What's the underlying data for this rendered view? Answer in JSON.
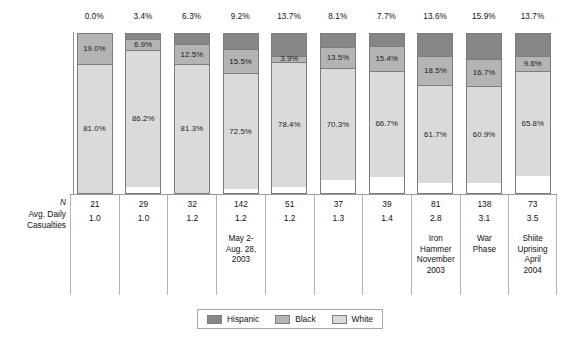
{
  "chart_data": {
    "type": "bar",
    "subtype": "stacked-100-percent",
    "title": "",
    "xlabel": "",
    "ylabel": "% of Total",
    "ylim": [
      0,
      100
    ],
    "grid": false,
    "legend_position": "bottom",
    "legend": [
      "Hispanic",
      "Black",
      "White"
    ],
    "categories": [
      "1",
      "2",
      "3",
      "4",
      "5",
      "6",
      "7",
      "8",
      "9",
      "10"
    ],
    "series": [
      {
        "name": "Hispanic",
        "color": "#878787",
        "values": [
          0.0,
          3.4,
          6.3,
          9.2,
          13.7,
          8.1,
          7.7,
          13.6,
          15.9,
          13.7
        ]
      },
      {
        "name": "Black",
        "color": "#b4b4b4",
        "values": [
          19.0,
          6.9,
          12.5,
          15.5,
          3.9,
          13.5,
          15.4,
          18.5,
          16.7,
          9.6
        ]
      },
      {
        "name": "White",
        "color": "#dadada",
        "values": [
          81.0,
          86.2,
          81.3,
          72.5,
          78.4,
          70.3,
          66.7,
          61.7,
          60.9,
          65.8
        ]
      }
    ],
    "top_labels": [
      "0.0%",
      "3.4%",
      "6.3%",
      "9.2%",
      "13.7%",
      "8.1%",
      "7.7%",
      "13.6%",
      "15.9%",
      "13.7%"
    ],
    "hispanic_labels": [
      "",
      "",
      "",
      "",
      "",
      "",
      "",
      "",
      "",
      ""
    ],
    "black_labels": [
      "19.0%",
      "6.9%",
      "12.5%",
      "15.5%",
      "3.9%",
      "13.5%",
      "15.4%",
      "18.5%",
      "16.7%",
      "9.6%"
    ],
    "white_labels": [
      "81.0%",
      "86.2%",
      "81.3%",
      "72.5%",
      "78.4%",
      "70.3%",
      "66.7%",
      "61.7%",
      "60.9%",
      "65.8%"
    ],
    "table": {
      "row_label_n": "N",
      "row_label_avg_line1": "Avg. Daily",
      "row_label_avg_line2": "Casualties",
      "n_values": [
        "21",
        "29",
        "32",
        "142",
        "51",
        "37",
        "39",
        "81",
        "138",
        "73"
      ],
      "avg_values": [
        "1.0",
        "1.0",
        "1.2",
        "1.2",
        "1.2",
        "1.3",
        "1.4",
        "2.8",
        "3.1",
        "3.5"
      ],
      "notes": [
        "",
        "",
        "",
        "May 2-\nAug. 28,\n2003",
        "",
        "",
        "",
        "Iron\nHammer\nNovember\n2003",
        "War\nPhase",
        "Shiite\nUprising\nApril\n2004"
      ]
    }
  }
}
